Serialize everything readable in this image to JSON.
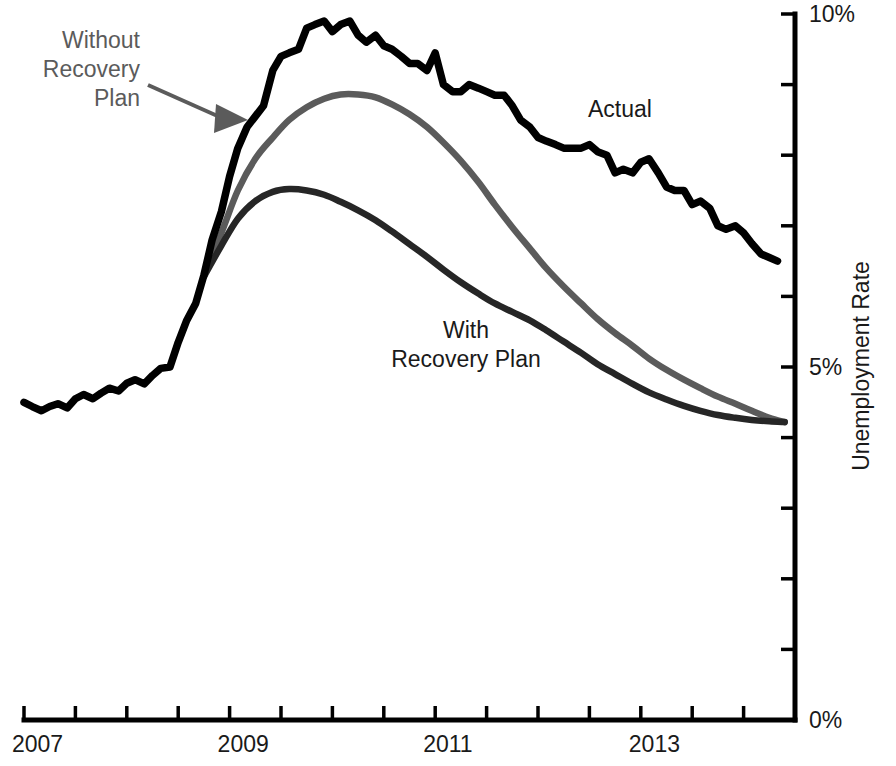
{
  "chart_data": {
    "type": "line",
    "title": "",
    "subtitle": "",
    "xlabel": "",
    "ylabel": "Unemployment Rate",
    "xlim": [
      2007.0,
      2014.5
    ],
    "ylim": [
      0,
      10
    ],
    "grid": false,
    "legend_position": "inline-annotations",
    "x_tick_labels": [
      "2007",
      "2009",
      "2011",
      "2013"
    ],
    "x_tick_values": [
      2007,
      2009,
      2011,
      2013
    ],
    "x_minor_tick_interval": 0.5,
    "y_tick_labels": [
      "0%",
      "5%",
      "10%"
    ],
    "y_tick_values": [
      0,
      5,
      10
    ],
    "y_minor_tick_interval": 1,
    "annotations": [
      {
        "name": "without-recovery-plan",
        "text_lines": [
          "Without",
          "Recovery",
          "Plan"
        ],
        "color": "#5b5b5b",
        "align": "right",
        "has_arrow": true
      },
      {
        "name": "actual",
        "text_lines": [
          "Actual"
        ],
        "color": "#1a1a1a",
        "align": "left",
        "has_arrow": false
      },
      {
        "name": "with-recovery-plan",
        "text_lines": [
          "With",
          "Recovery Plan"
        ],
        "color": "#1a1a1a",
        "align": "center",
        "has_arrow": false
      }
    ],
    "series": [
      {
        "name": "Actual",
        "color": "#000000",
        "x": [
          2007.0,
          2007.08,
          2007.17,
          2007.25,
          2007.33,
          2007.42,
          2007.5,
          2007.58,
          2007.67,
          2007.75,
          2007.83,
          2007.92,
          2008.0,
          2008.08,
          2008.17,
          2008.25,
          2008.33,
          2008.42,
          2008.5,
          2008.58,
          2008.67,
          2008.75,
          2008.83,
          2008.92,
          2009.0,
          2009.08,
          2009.17,
          2009.25,
          2009.33,
          2009.42,
          2009.5,
          2009.58,
          2009.67,
          2009.75,
          2009.83,
          2009.92,
          2010.0,
          2010.08,
          2010.17,
          2010.25,
          2010.33,
          2010.42,
          2010.5,
          2010.58,
          2010.67,
          2010.75,
          2010.83,
          2010.92,
          2011.0,
          2011.08,
          2011.17,
          2011.25,
          2011.33,
          2011.42,
          2011.5,
          2011.58,
          2011.67,
          2011.75,
          2011.83,
          2011.92,
          2012.0,
          2012.08,
          2012.17,
          2012.25,
          2012.33,
          2012.42,
          2012.5,
          2012.58,
          2012.67,
          2012.75,
          2012.83,
          2012.92,
          2013.0,
          2013.08,
          2013.17,
          2013.25,
          2013.33,
          2013.42,
          2013.5,
          2013.58,
          2013.67,
          2013.75,
          2013.83,
          2013.92,
          2014.0,
          2014.08,
          2014.17,
          2014.25,
          2014.33
        ],
        "values": [
          4.5,
          4.44,
          4.38,
          4.44,
          4.48,
          4.42,
          4.55,
          4.61,
          4.55,
          4.63,
          4.7,
          4.66,
          4.77,
          4.82,
          4.76,
          4.88,
          4.98,
          5.0,
          5.35,
          5.65,
          5.9,
          6.3,
          6.8,
          7.2,
          7.7,
          8.1,
          8.4,
          8.55,
          8.7,
          9.2,
          9.4,
          9.45,
          9.5,
          9.8,
          9.85,
          9.9,
          9.75,
          9.85,
          9.9,
          9.7,
          9.6,
          9.7,
          9.55,
          9.5,
          9.4,
          9.3,
          9.3,
          9.2,
          9.45,
          9.0,
          8.9,
          8.9,
          9.0,
          8.95,
          8.9,
          8.85,
          8.85,
          8.7,
          8.5,
          8.4,
          8.25,
          8.2,
          8.15,
          8.1,
          8.1,
          8.1,
          8.15,
          8.05,
          8.0,
          7.75,
          7.8,
          7.75,
          7.9,
          7.95,
          7.75,
          7.55,
          7.5,
          7.5,
          7.3,
          7.35,
          7.25,
          7.0,
          6.95,
          7.0,
          6.9,
          6.75,
          6.6,
          6.55,
          6.5
        ]
      },
      {
        "name": "Without Recovery Plan",
        "color": "#5b5b5b",
        "x": [
          2008.75,
          2008.92,
          2009.08,
          2009.25,
          2009.42,
          2009.58,
          2009.75,
          2009.92,
          2010.08,
          2010.25,
          2010.42,
          2010.58,
          2010.75,
          2010.92,
          2011.08,
          2011.25,
          2011.42,
          2011.58,
          2011.75,
          2011.92,
          2012.08,
          2012.25,
          2012.42,
          2012.58,
          2012.75,
          2012.92,
          2013.08,
          2013.25,
          2013.42,
          2013.58,
          2013.75,
          2013.92,
          2014.08,
          2014.25,
          2014.4
        ],
        "values": [
          6.3,
          6.9,
          7.5,
          7.95,
          8.25,
          8.5,
          8.68,
          8.8,
          8.86,
          8.86,
          8.82,
          8.72,
          8.58,
          8.4,
          8.18,
          7.92,
          7.62,
          7.3,
          6.98,
          6.68,
          6.4,
          6.14,
          5.9,
          5.68,
          5.48,
          5.3,
          5.12,
          4.96,
          4.82,
          4.7,
          4.58,
          4.48,
          4.38,
          4.28,
          4.22
        ]
      },
      {
        "name": "With Recovery Plan",
        "color": "#262626",
        "x": [
          2008.75,
          2008.92,
          2009.08,
          2009.25,
          2009.42,
          2009.58,
          2009.75,
          2009.92,
          2010.08,
          2010.25,
          2010.42,
          2010.58,
          2010.75,
          2010.92,
          2011.08,
          2011.25,
          2011.42,
          2011.58,
          2011.75,
          2011.92,
          2012.08,
          2012.25,
          2012.42,
          2012.58,
          2012.75,
          2012.92,
          2013.08,
          2013.25,
          2013.42,
          2013.58,
          2013.75,
          2013.92,
          2014.08,
          2014.25,
          2014.4
        ],
        "values": [
          6.28,
          6.72,
          7.1,
          7.35,
          7.48,
          7.52,
          7.5,
          7.44,
          7.34,
          7.22,
          7.08,
          6.92,
          6.74,
          6.56,
          6.38,
          6.2,
          6.04,
          5.9,
          5.78,
          5.66,
          5.52,
          5.36,
          5.2,
          5.04,
          4.9,
          4.76,
          4.64,
          4.54,
          4.45,
          4.38,
          4.32,
          4.28,
          4.25,
          4.23,
          4.22
        ]
      }
    ]
  },
  "axes": {
    "y_axis_title": "Unemployment Rate",
    "y_ticks": [
      {
        "label": "10%",
        "value": 10
      },
      {
        "label": "",
        "value": 9
      },
      {
        "label": "",
        "value": 8
      },
      {
        "label": "",
        "value": 7
      },
      {
        "label": "",
        "value": 6
      },
      {
        "label": "5%",
        "value": 5
      },
      {
        "label": "",
        "value": 4
      },
      {
        "label": "",
        "value": 3
      },
      {
        "label": "",
        "value": 2
      },
      {
        "label": "",
        "value": 1
      },
      {
        "label": "0%",
        "value": 0
      }
    ],
    "x_ticks": [
      {
        "label": "2007",
        "value": 2007.0
      },
      {
        "label": "",
        "value": 2007.5
      },
      {
        "label": "",
        "value": 2008.0
      },
      {
        "label": "",
        "value": 2008.5
      },
      {
        "label": "2009",
        "value": 2009.0
      },
      {
        "label": "",
        "value": 2009.5
      },
      {
        "label": "",
        "value": 2010.0
      },
      {
        "label": "",
        "value": 2010.5
      },
      {
        "label": "2011",
        "value": 2011.0
      },
      {
        "label": "",
        "value": 2011.5
      },
      {
        "label": "",
        "value": 2012.0
      },
      {
        "label": "",
        "value": 2012.5
      },
      {
        "label": "2013",
        "value": 2013.0
      },
      {
        "label": "",
        "value": 2013.5
      },
      {
        "label": "",
        "value": 2014.0
      },
      {
        "label": "",
        "value": 2014.5
      }
    ]
  },
  "labels": {
    "without_line1": "Without",
    "without_line2": "Recovery",
    "without_line3": "Plan",
    "actual": "Actual",
    "with_line1": "With",
    "with_line2": "Recovery Plan",
    "y_axis": "Unemployment Rate",
    "x_2007": "2007",
    "x_2009": "2009",
    "x_2011": "2011",
    "x_2013": "2013",
    "y_0": "0%",
    "y_5": "5%",
    "y_10": "10%"
  }
}
